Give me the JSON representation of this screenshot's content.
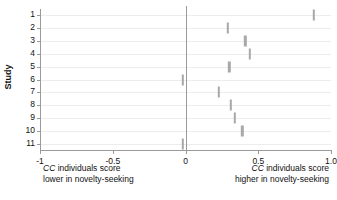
{
  "chart_data": {
    "type": "scatter",
    "subtype": "forest-plot",
    "title": "",
    "xlabel": "",
    "ylabel": "Study",
    "xlim": [
      -1,
      1
    ],
    "ylim": [
      0.5,
      11.5
    ],
    "grid": "horizontal-only",
    "legend": "none",
    "reference_line": 0,
    "x_ticks": [
      {
        "value": -1,
        "label": "-1"
      },
      {
        "value": -0.5,
        "label": "-0.5"
      },
      {
        "value": 0,
        "label": "0"
      },
      {
        "value": 0.5,
        "label": "0.5"
      },
      {
        "value": 1,
        "label": "1.0"
      }
    ],
    "y_ticks": [
      {
        "value": 1,
        "label": "1"
      },
      {
        "value": 2,
        "label": "2"
      },
      {
        "value": 3,
        "label": "3"
      },
      {
        "value": 4,
        "label": "4"
      },
      {
        "value": 5,
        "label": "5"
      },
      {
        "value": 6,
        "label": "6"
      },
      {
        "value": 7,
        "label": "7"
      },
      {
        "value": 8,
        "label": "8"
      },
      {
        "value": 9,
        "label": "9"
      },
      {
        "value": 10,
        "label": "10"
      },
      {
        "value": 11,
        "label": "11"
      }
    ],
    "categories": [
      "1",
      "2",
      "3",
      "4",
      "5",
      "6",
      "7",
      "8",
      "9",
      "10",
      "11"
    ],
    "values": [
      0.88,
      0.29,
      0.41,
      0.44,
      0.3,
      -0.02,
      0.23,
      0.31,
      0.34,
      0.39,
      -0.02
    ],
    "points": [
      {
        "study": "1",
        "effect": 0.88
      },
      {
        "study": "2",
        "effect": 0.29
      },
      {
        "study": "3",
        "effect": 0.41
      },
      {
        "study": "4",
        "effect": 0.44
      },
      {
        "study": "5",
        "effect": 0.3
      },
      {
        "study": "6",
        "effect": -0.02
      },
      {
        "study": "7",
        "effect": 0.23
      },
      {
        "study": "8",
        "effect": 0.31
      },
      {
        "study": "9",
        "effect": 0.34
      },
      {
        "study": "10",
        "effect": 0.39
      },
      {
        "study": "11",
        "effect": -0.02
      }
    ],
    "annotations": {
      "left_line1": "CC individuals score",
      "left_line2": "lower in novelty-seeking",
      "right_line1": "CC individuals score",
      "right_line2": "higher in novelty-seeking"
    },
    "colors": {
      "marker": "#a8a8a8",
      "axis": "#9a9a9a",
      "gridline": "#ededed",
      "text": "#111111",
      "background": "#ffffff"
    }
  }
}
